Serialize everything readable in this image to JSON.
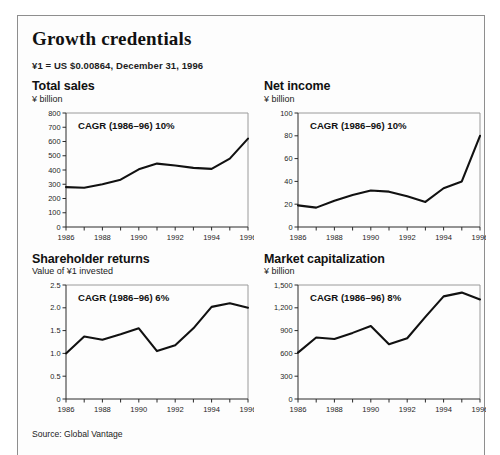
{
  "exhibit": {
    "title": "Growth credentials",
    "fx_note": "¥1 = US $0.00864, December 31, 1996",
    "source": "Source: Global Vantage"
  },
  "chart_data": [
    {
      "type": "line",
      "title": "Total sales",
      "ylabel": "¥ billion",
      "annotation": "CAGR (1986–96) 10%",
      "xlabel": "",
      "x": [
        1986,
        1987,
        1988,
        1989,
        1990,
        1991,
        1992,
        1993,
        1994,
        1995,
        1996
      ],
      "values": [
        280,
        275,
        300,
        332,
        405,
        445,
        432,
        415,
        408,
        480,
        620
      ],
      "ylim": [
        0,
        800
      ],
      "yticks": [
        0,
        100,
        200,
        300,
        400,
        500,
        600,
        700,
        800
      ],
      "ytick_labels": [
        "0",
        "100",
        "200",
        "300",
        "400",
        "500",
        "600",
        "700",
        "800"
      ],
      "xticks": [
        1986,
        1987,
        1988,
        1989,
        1990,
        1991,
        1992,
        1993,
        1994,
        1995,
        1996
      ],
      "xtick_labels": [
        "1986",
        "",
        "1988",
        "",
        "1990",
        "",
        "1992",
        "",
        "1994",
        "",
        "1996"
      ],
      "grid": false,
      "legend": "none"
    },
    {
      "type": "line",
      "title": "Net income",
      "ylabel": "¥ billion",
      "annotation": "CAGR (1986–96) 10%",
      "xlabel": "",
      "x": [
        1986,
        1987,
        1988,
        1989,
        1990,
        1991,
        1992,
        1993,
        1994,
        1995,
        1996
      ],
      "values": [
        19,
        17,
        23,
        28,
        32,
        31,
        27,
        22,
        34,
        40,
        80
      ],
      "ylim": [
        0,
        100
      ],
      "yticks": [
        0,
        20,
        40,
        60,
        80,
        100
      ],
      "ytick_labels": [
        "0",
        "20",
        "40",
        "60",
        "80",
        "100"
      ],
      "xticks": [
        1986,
        1987,
        1988,
        1989,
        1990,
        1991,
        1992,
        1993,
        1994,
        1995,
        1996
      ],
      "xtick_labels": [
        "1986",
        "",
        "1988",
        "",
        "1990",
        "",
        "1992",
        "",
        "1994",
        "",
        "1996"
      ],
      "grid": false,
      "legend": "none"
    },
    {
      "type": "line",
      "title": "Shareholder returns",
      "ylabel": "Value of ¥1 invested",
      "annotation": "CAGR (1986–96) 6%",
      "xlabel": "",
      "x": [
        1986,
        1987,
        1988,
        1989,
        1990,
        1991,
        1992,
        1993,
        1994,
        1995,
        1996
      ],
      "values": [
        1.0,
        1.37,
        1.3,
        1.42,
        1.55,
        1.05,
        1.18,
        1.55,
        2.02,
        2.1,
        2.0
      ],
      "ylim": [
        0,
        2.5
      ],
      "yticks": [
        0,
        0.5,
        1.0,
        1.5,
        2.0,
        2.5
      ],
      "ytick_labels": [
        "0",
        "0.5",
        "1.0",
        "1.5",
        "2.0",
        "2.5"
      ],
      "xticks": [
        1986,
        1987,
        1988,
        1989,
        1990,
        1991,
        1992,
        1993,
        1994,
        1995,
        1996
      ],
      "xtick_labels": [
        "1986",
        "",
        "1988",
        "",
        "1990",
        "",
        "1992",
        "",
        "1994",
        "",
        "1996"
      ],
      "grid": false,
      "legend": "none"
    },
    {
      "type": "line",
      "title": "Market capitalization",
      "ylabel": "¥ billion",
      "annotation": "CAGR (1986–96) 8%",
      "xlabel": "",
      "x": [
        1986,
        1987,
        1988,
        1989,
        1990,
        1991,
        1992,
        1993,
        1994,
        1995,
        1996
      ],
      "values": [
        610,
        810,
        790,
        870,
        960,
        720,
        800,
        1080,
        1350,
        1400,
        1310
      ],
      "ylim": [
        0,
        1500
      ],
      "yticks": [
        0,
        300,
        600,
        900,
        1200,
        1500
      ],
      "ytick_labels": [
        "0",
        "300",
        "600",
        "900",
        "1,200",
        "1,500"
      ],
      "xticks": [
        1986,
        1987,
        1988,
        1989,
        1990,
        1991,
        1992,
        1993,
        1994,
        1995,
        1996
      ],
      "xtick_labels": [
        "1986",
        "",
        "1988",
        "",
        "1990",
        "",
        "1992",
        "",
        "1994",
        "",
        "1996"
      ],
      "grid": false,
      "legend": "none"
    }
  ],
  "colors": {
    "line": "#111111",
    "axis": "#2b2b2b",
    "frame": "#9a9a9a",
    "border": "#8e8e8e",
    "text": "#1a1a1a"
  }
}
